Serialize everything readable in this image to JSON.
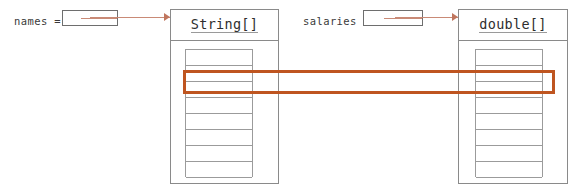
{
  "diagram": {
    "background_color": "#ffffff",
    "highlight_color": "#bf5520",
    "arrow_color": "#c0765e",
    "box_border_color": "#8a8a8a",
    "cell_border_color": "#9b9b9b"
  },
  "variables": [
    {
      "name": "names",
      "label": "names =",
      "pointer_value": "",
      "points_to": "String[]"
    },
    {
      "name": "salaries",
      "label": "salaries =",
      "pointer_value": "",
      "points_to": "double[]"
    }
  ],
  "arrays": [
    {
      "id": "string-array",
      "type_label": "String[]",
      "cell_count": 8,
      "highlighted_index": 1,
      "cells": [
        "",
        "",
        "",
        "",
        "",
        "",
        "",
        ""
      ]
    },
    {
      "id": "double-array",
      "type_label": "double[]",
      "cell_count": 8,
      "highlighted_index": 1,
      "cells": [
        "",
        "",
        "",
        "",
        "",
        "",
        "",
        ""
      ]
    }
  ],
  "highlight": {
    "label": "",
    "description": "Rectangle linking index 1 of both arrays"
  }
}
